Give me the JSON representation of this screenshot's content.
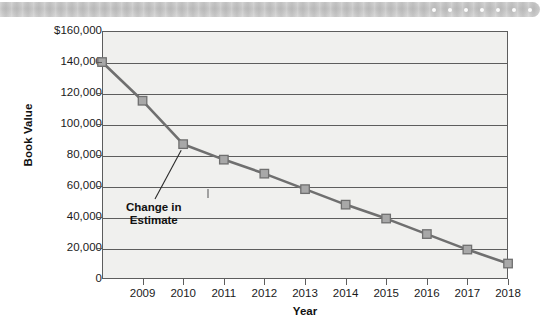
{
  "banner": {
    "dot_count": 7,
    "dot_color": "#fdfdfd",
    "background_color": "#c4c4c4"
  },
  "chart_data": {
    "type": "line",
    "title": "",
    "xlabel": "Year",
    "ylabel": "Book Value",
    "x": [
      2008,
      2009,
      2010,
      2011,
      2012,
      2013,
      2014,
      2015,
      2016,
      2017,
      2018
    ],
    "tick_labels": [
      "",
      "2009",
      "2010",
      "2011",
      "2012",
      "2013",
      "2014",
      "2015",
      "2016",
      "2017",
      "2018"
    ],
    "values": [
      140000,
      115000,
      87000,
      77000,
      68000,
      58000,
      48000,
      39000,
      29000,
      19000,
      10000
    ],
    "ylim": [
      0,
      160000
    ],
    "ytick_values": [
      160000,
      140000,
      120000,
      100000,
      80000,
      60000,
      40000,
      20000,
      0
    ],
    "ytick_labels": [
      "$160,000",
      "140,000",
      "120,000",
      "100,000",
      "80,000",
      "60,000",
      "40,000",
      "20,000",
      "0"
    ],
    "grid": true,
    "legend": "none",
    "series_color": "#6f6f6f",
    "marker_fill": "#a8a8a8",
    "marker_edge": "#6f6f6f",
    "marker_shape": "square",
    "plot_background": "#f0f0ee",
    "annotations": [
      {
        "text": "Change in\nEstimate",
        "points_to_x": 2010,
        "points_to_y": 87000
      }
    ]
  }
}
